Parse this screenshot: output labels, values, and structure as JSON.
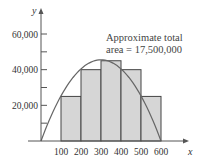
{
  "chart_data": {
    "type": "bar",
    "title": "",
    "xlabel": "x",
    "ylabel": "y",
    "categories": [
      "100-200",
      "200-300",
      "300-400",
      "400-500",
      "500-600"
    ],
    "bar_edges": [
      100,
      200,
      300,
      400,
      500,
      600
    ],
    "values": [
      25000,
      40000,
      45000,
      40000,
      25000
    ],
    "curve": {
      "description": "parabola from (0,0) peaking near (350, 45000) to (600, 0)"
    },
    "x_ticks": [
      "100",
      "200",
      "300",
      "400",
      "500",
      "600"
    ],
    "y_ticks": [
      "20,000",
      "40,000",
      "60,000"
    ],
    "xlim": [
      0,
      650
    ],
    "ylim": [
      0,
      65000
    ],
    "grid": false,
    "annotation": [
      "Approximate total",
      "area = 17,500,000"
    ],
    "colors": {
      "bar_fill": "#d6d6d6",
      "bar_edge": "#444444",
      "curve": "#666666",
      "axis": "#555555"
    }
  }
}
